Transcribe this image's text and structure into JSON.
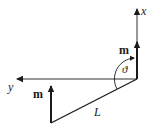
{
  "labels": {
    "x_axis": "x",
    "y_axis": "y",
    "moment_top": "m",
    "moment_bottom": "m",
    "angle": "ϑ",
    "length": "L"
  },
  "colors": {
    "stroke": "#1a1a1a",
    "background": "#ffffff"
  }
}
